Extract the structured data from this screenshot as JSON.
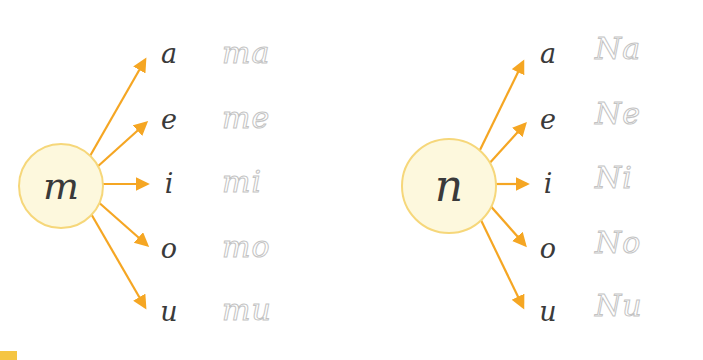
{
  "worksheet": {
    "title": "Cursive syllable tracing worksheet",
    "groups": [
      {
        "id": "group-m",
        "hub_letter": "m",
        "rows": [
          {
            "vowel": "a",
            "syllable": "ma"
          },
          {
            "vowel": "e",
            "syllable": "me"
          },
          {
            "vowel": "i",
            "syllable": "mi"
          },
          {
            "vowel": "o",
            "syllable": "mo"
          },
          {
            "vowel": "u",
            "syllable": "mu"
          }
        ]
      },
      {
        "id": "group-n",
        "hub_letter": "n",
        "rows": [
          {
            "vowel": "a",
            "syllable": "Na"
          },
          {
            "vowel": "e",
            "syllable": "Ne"
          },
          {
            "vowel": "i",
            "syllable": "Ni"
          },
          {
            "vowel": "o",
            "syllable": "No"
          },
          {
            "vowel": "u",
            "syllable": "Nu"
          }
        ]
      }
    ],
    "colors": {
      "hub_fill": "#fdf8dd",
      "hub_border": "#f6d77a",
      "arrow": "#f5a623",
      "letter": "#3a3a3a",
      "trace": "#b9b9b9",
      "corner_mark": "#f5c542"
    }
  }
}
